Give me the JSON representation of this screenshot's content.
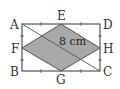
{
  "diagram": {
    "type": "geometry",
    "rectangle": {
      "vertices": [
        "A",
        "D",
        "C",
        "B"
      ]
    },
    "midpoints": {
      "E": "AD",
      "F": "AB",
      "G": "BC",
      "H": "DC"
    },
    "rhombus": {
      "vertices": [
        "E",
        "H",
        "G",
        "F"
      ],
      "fill": "#a9a9a9"
    },
    "diagonal": [
      "A",
      "C"
    ],
    "labels": {
      "A": "A",
      "B": "B",
      "C": "C",
      "D": "D",
      "E": "E",
      "F": "F",
      "G": "G",
      "H": "H"
    },
    "measurement": "8 cm",
    "colors": {
      "line": "#555555",
      "fill": "#a9a9a9"
    }
  }
}
